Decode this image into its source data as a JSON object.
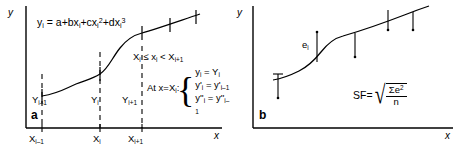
{
  "figure": {
    "width": 462,
    "height": 148,
    "background": "#ffffff",
    "ink": "#000000"
  },
  "panel_a": {
    "tag": "a",
    "y_axis_label": "y",
    "x_axis_label": "x",
    "equation": "y<sub>i</sub> = a+bx<sub>i</sub>+cx<sub>i</sub><sup>2</sup>+dx<sub>i</sub><sup>3</sup>",
    "interval_condition": "X<sub>i</sub> ≤ x<sub>i</sub> < X<sub>i+1</sub>",
    "at_label": "At x=X<sub>i</sub>:",
    "system": [
      "y<sub>i</sub> = Y<sub>i</sub>",
      "y'<sub>i</sub> = y'<sub>i–1</sub>",
      "y''<sub>i</sub> = y''<sub>i–1</sub>"
    ],
    "x_ticks": [
      "X<sub>i–1</sub>",
      "X<sub>i</sub>",
      "X<sub>i+1</sub>"
    ],
    "y_labels": [
      "Y<sub>i–1</sub>",
      "Y<sub>i</sub>",
      "Y<sub>i+1</sub>"
    ]
  },
  "panel_b": {
    "tag": "b",
    "y_axis_label": "y",
    "x_axis_label": "x",
    "error_label": "e<sub>i</sub>",
    "sf_label": "SF=",
    "sf_numerator": "Σe<sup>2</sup>",
    "sf_denominator": "n"
  },
  "chart_data": {
    "type": "line",
    "title": "",
    "panels": [
      {
        "id": "a",
        "description": "Cubic spline segments fitted through knot points",
        "xlabel": "x",
        "ylabel": "y",
        "knots_x": [
          0.18,
          0.4,
          0.62,
          0.78,
          0.92
        ],
        "knots_y": [
          0.3,
          0.44,
          0.72,
          0.8,
          0.87
        ],
        "dashed_verticals_at": [
          "X_i-1",
          "X_i",
          "X_i+1"
        ],
        "grid": false,
        "legend": "none"
      },
      {
        "id": "b",
        "description": "Smoothing spline with residual error bars e_i at each data point",
        "xlabel": "x",
        "ylabel": "y",
        "points_x": [
          0.14,
          0.38,
          0.6,
          0.78,
          0.88
        ],
        "points_y": [
          0.3,
          0.52,
          0.68,
          0.8,
          0.85
        ],
        "residual_directions": [
          "down",
          "up",
          "down",
          "down",
          "down"
        ],
        "grid": false,
        "legend": "none"
      }
    ]
  }
}
